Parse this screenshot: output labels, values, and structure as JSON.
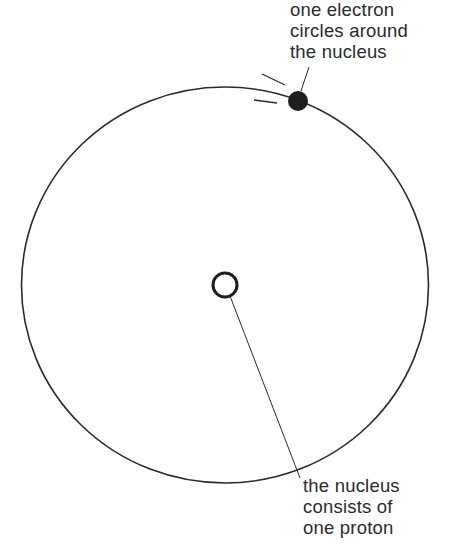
{
  "diagram": {
    "type": "atom-model",
    "labels": {
      "electron": [
        "one electron",
        "circles around",
        "the nucleus"
      ],
      "nucleus": [
        "the nucleus",
        "consists of",
        "one proton"
      ]
    },
    "elements": {
      "orbit": {
        "cx": 225,
        "cy": 285,
        "rx": 203,
        "ry": 198
      },
      "nucleus": {
        "cx": 225,
        "cy": 285,
        "r": 12
      },
      "electron": {
        "cx": 298,
        "cy": 101,
        "r": 10
      }
    },
    "colors": {
      "line": "#2b2b2b",
      "background": "#ffffff"
    }
  }
}
